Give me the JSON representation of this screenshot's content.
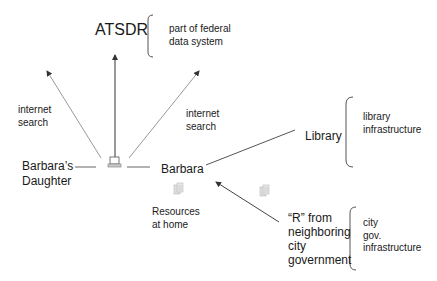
{
  "diagram": {
    "nodes": {
      "atsdr": {
        "label": "ATSDR",
        "note_lines": [
          "part of federal",
          "data system"
        ]
      },
      "daughter": {
        "label_lines": [
          "Barbara’s",
          "Daughter"
        ]
      },
      "barbara": {
        "label": "Barbara"
      },
      "library": {
        "label": "Library",
        "note_lines": [
          "library",
          "infrastructure"
        ]
      },
      "resources": {
        "label_lines": [
          "Resources",
          "at home"
        ]
      },
      "city": {
        "label_lines": [
          "“R” from",
          "neighboring",
          "city",
          "government"
        ],
        "note_lines": [
          "city",
          "gov.",
          "infrastructure"
        ]
      }
    },
    "edge_labels": {
      "left_search": [
        "internet",
        "search"
      ],
      "right_search": [
        "internet",
        "search"
      ]
    },
    "icons": {
      "computer": "computer-icon",
      "document_home": "document-icon",
      "document_city": "document-icon"
    },
    "colors": {
      "line": "#555555",
      "arrow_dotted": "#888888",
      "text": "#1a1a1a",
      "icon": "#b5b5b5"
    }
  }
}
